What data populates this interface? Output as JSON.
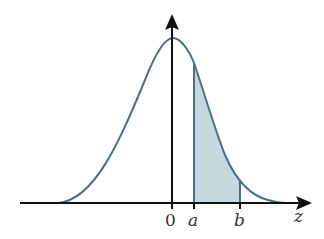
{
  "diagram": {
    "type": "standard-normal-curve-shaded-area",
    "labels": {
      "origin": "0",
      "a": "a",
      "b": "b",
      "axis": "z"
    },
    "colors": {
      "curve": "#4d6e87",
      "shade": "#c5d8de",
      "axis": "#111111",
      "text": "#333333"
    }
  }
}
